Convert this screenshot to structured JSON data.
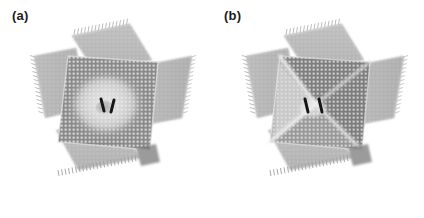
{
  "figure": {
    "background_color": "#ffffff",
    "width": 424,
    "height": 218,
    "kind": "scientific-illustration"
  },
  "panels": [
    {
      "id": "a",
      "label": "(a)",
      "center_feature": "circular dome bulge",
      "center_feature_name": "radial-dome-halo",
      "membrane_shade": "#8d8d8d",
      "flap_shade": "#b9b9b9",
      "highlight_shade": "#ededed",
      "cargo_count": 2,
      "cargo_color": "#161616"
    },
    {
      "id": "b",
      "label": "(b)",
      "center_feature": "X-shaped pyramidal crease pattern",
      "center_feature_name": "diagonal-crease-x",
      "membrane_shade": "#7e7e7e",
      "flap_shade": "#b9b9b9",
      "highlight_shade": "#e4e4e4",
      "cargo_count": 2,
      "cargo_color": "#161616"
    }
  ],
  "colors": {
    "background": "#ffffff",
    "label_text": "#1c1c1c",
    "sheet_dark": "#7c7c7c",
    "sheet_mid": "#969696",
    "sheet_light": "#c2c2c2",
    "flap_gray": "#b9b9b9",
    "flap_gray_dark": "#a8a8a8",
    "crease_light": "#ececec",
    "shadow": "#6a6a6a",
    "cargo": "#161616"
  }
}
